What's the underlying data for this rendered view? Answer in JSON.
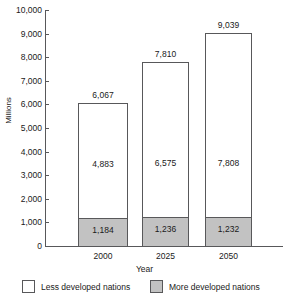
{
  "chart_data": {
    "type": "bar",
    "subtype": "stacked-bar",
    "title": "",
    "xlabel": "Year",
    "ylabel": "Millions",
    "categories": [
      "2000",
      "2025",
      "2050"
    ],
    "ylim": [
      0,
      10000
    ],
    "ytick_step": 1000,
    "ytick_labels": [
      "10,000",
      "9,000",
      "8,000",
      "7,000",
      "6,000",
      "5,000",
      "4,000",
      "3,000",
      "2,000",
      "1,000",
      "0"
    ],
    "ytick_values": [
      10000,
      9000,
      8000,
      7000,
      6000,
      5000,
      4000,
      3000,
      2000,
      1000,
      0
    ],
    "grid": false,
    "legend_position": "bottom",
    "series": [
      {
        "name": "More developed nations",
        "color": "#c2c2c2",
        "values": [
          1184,
          1236,
          1232
        ],
        "labels": [
          "1,184",
          "1,236",
          "1,232"
        ]
      },
      {
        "name": "Less developed nations",
        "color": "#ffffff",
        "values": [
          4883,
          6575,
          7808
        ],
        "labels": [
          "4,883",
          "6,575",
          "7,808"
        ]
      }
    ],
    "totals": [
      6067,
      7810,
      9039
    ],
    "total_labels": [
      "6,067",
      "7,810",
      "9,039"
    ]
  },
  "axes": {
    "y_title": "Millions",
    "x_title": "Year",
    "y_ticks": [
      {
        "label": "10,000",
        "value": 10000
      },
      {
        "label": "9,000",
        "value": 9000
      },
      {
        "label": "8,000",
        "value": 8000
      },
      {
        "label": "7,000",
        "value": 7000
      },
      {
        "label": "6,000",
        "value": 6000
      },
      {
        "label": "5,000",
        "value": 5000
      },
      {
        "label": "4,000",
        "value": 4000
      },
      {
        "label": "3,000",
        "value": 3000
      },
      {
        "label": "2,000",
        "value": 2000
      },
      {
        "label": "1,000",
        "value": 1000
      },
      {
        "label": "0",
        "value": 0
      }
    ],
    "x_ticks": [
      "2000",
      "2025",
      "2050"
    ]
  },
  "legend": {
    "entries": [
      {
        "label": "Less developed nations",
        "swatch": "light"
      },
      {
        "label": "More developed nations",
        "swatch": "dark"
      }
    ]
  },
  "colors": {
    "less_developed": "#ffffff",
    "more_developed": "#c2c2c2",
    "outline": "#58585a",
    "text": "#1a1a1a",
    "background": "#ffffff"
  }
}
